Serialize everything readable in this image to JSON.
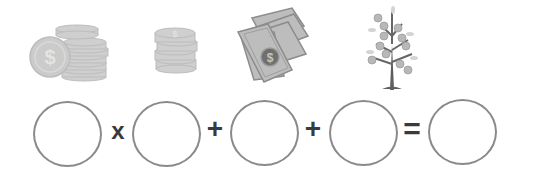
{
  "pictures": [
    {
      "name": "big-coin-stack",
      "label": "coins"
    },
    {
      "name": "small-coin-stack",
      "label": "coins"
    },
    {
      "name": "banknotes",
      "label": "bills"
    },
    {
      "name": "money-tree",
      "label": "money tree"
    }
  ],
  "equation": {
    "operators": [
      "x",
      "+",
      "+",
      "="
    ],
    "answer_boxes": [
      "",
      "",
      "",
      "",
      ""
    ]
  },
  "colors": {
    "icon_gray": "#c8c8c8",
    "icon_dark": "#7a7a7a",
    "circle_border": "#8a8a8a",
    "operator": "#3a3a3a"
  }
}
